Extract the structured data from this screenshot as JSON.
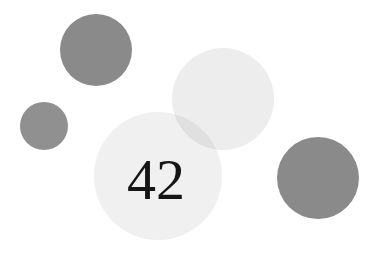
{
  "canvas": {
    "width": 381,
    "height": 260,
    "background_color": "#ffffff"
  },
  "figure": {
    "kind": "abstract-circles-composition",
    "label": "42",
    "label_color": "#151515"
  },
  "palette": {
    "dark_gray": "#8a8a8a",
    "mid_gray": "#909090",
    "light_gray": "#ededed",
    "lighter_gray": "#f0f0f0",
    "overlap_gray": "#e0e0e0",
    "background": "#ffffff"
  },
  "shapes": [
    {
      "name": "circle-dark-top-left",
      "cx": 96,
      "cy": 50,
      "r": 36,
      "color": "#8a8a8a",
      "opacity": 1
    },
    {
      "name": "circle-dark-small-left",
      "cx": 44,
      "cy": 126,
      "r": 24,
      "color": "#909090",
      "opacity": 1
    },
    {
      "name": "circle-light-top-right",
      "cx": 223,
      "cy": 99,
      "r": 51,
      "color": "#ededed",
      "opacity": 1
    },
    {
      "name": "circle-light-main-42",
      "cx": 158,
      "cy": 176,
      "r": 64,
      "color": "#f0f0f0",
      "opacity": 1
    },
    {
      "name": "circle-dark-bottom-right",
      "cx": 318,
      "cy": 178,
      "r": 41,
      "color": "#8a8a8a",
      "opacity": 1
    }
  ],
  "text_elements": [
    {
      "name": "big-number-42",
      "value": "42",
      "x": 156,
      "y": 199,
      "font_size": 58,
      "color": "#151515"
    }
  ]
}
